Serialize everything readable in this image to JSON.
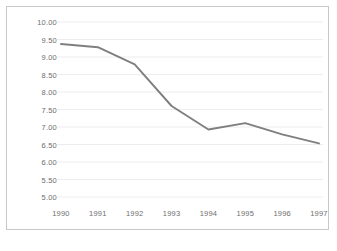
{
  "chart_data": {
    "type": "line",
    "title": "",
    "xlabel": "",
    "ylabel": "",
    "categories": [
      "1990",
      "1991",
      "1992",
      "1993",
      "1994",
      "1995",
      "1996",
      "1997"
    ],
    "values": [
      9.37,
      9.28,
      8.79,
      7.6,
      6.93,
      7.11,
      6.79,
      6.53
    ],
    "series": [
      {
        "name": "series-1",
        "values": [
          9.37,
          9.28,
          8.79,
          7.6,
          6.93,
          7.11,
          6.79,
          6.53
        ]
      }
    ],
    "ylim": [
      5.0,
      10.0
    ],
    "y_ticks": [
      "5.00",
      "5.50",
      "6.00",
      "6.50",
      "7.00",
      "7.50",
      "8.00",
      "8.50",
      "9.00",
      "9.50",
      "10.00"
    ],
    "y_tick_values": [
      5.0,
      5.5,
      6.0,
      6.5,
      7.0,
      7.5,
      8.0,
      8.5,
      9.0,
      9.5,
      10.0
    ],
    "x_ticks": [
      "1990",
      "1991",
      "1992",
      "1993",
      "1994",
      "1995",
      "1996",
      "1997"
    ],
    "grid": true,
    "grid_axis": "y",
    "legend": false,
    "legend_position": "none",
    "colors": {
      "line": "#7f7f7f",
      "grid": "#ededed",
      "border": "#c8c8c8",
      "tick_text": "#6e6e6e",
      "plot_background": "#ffffff",
      "page_background": "#ffffff"
    }
  }
}
